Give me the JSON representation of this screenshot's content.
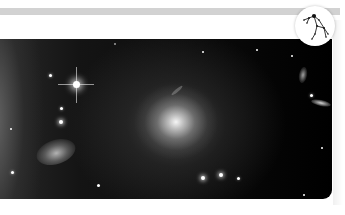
{
  "header": {
    "bar_color": "#d2d2d2",
    "band_color": "#ffffff"
  },
  "photo": {
    "subject": "elliptical galaxy with stars and spiral galaxy",
    "description_icon": "galaxy-image",
    "corner_radius_px": 9
  },
  "badge": {
    "icon": "constellation-icon",
    "background": "#ffffff"
  },
  "colors": {
    "space_dark": "#000000",
    "galaxy_core": "#ffffff",
    "stroke": "#222222"
  }
}
